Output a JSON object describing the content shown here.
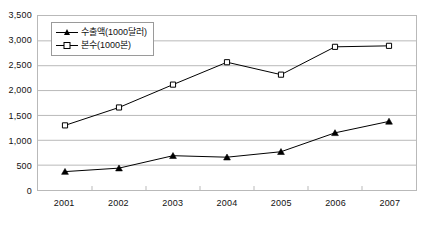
{
  "chart_data": {
    "type": "line",
    "title": "",
    "subtitle": "",
    "xlabel": "",
    "ylabel": "",
    "categories": [
      "2001",
      "2002",
      "2003",
      "2004",
      "2005",
      "2006",
      "2007"
    ],
    "x_tick_labels": [
      "2001",
      "2002",
      "2003",
      "2004",
      "2005",
      "2006",
      "2007"
    ],
    "y_tick_labels": [
      "0",
      "500",
      "1,000",
      "1,500",
      "2,000",
      "2,500",
      "3,000",
      "3,500"
    ],
    "y_tick_values": [
      0,
      500,
      1000,
      1500,
      2000,
      2500,
      3000,
      3500
    ],
    "ylim": [
      0,
      3500
    ],
    "y_step": 500,
    "grid": true,
    "grid_axis": "y",
    "legend_position": "top-left-inside",
    "series": [
      {
        "name": "수출액(1000달러)",
        "marker": "filled-triangle",
        "color": "#000000",
        "values": [
          370,
          440,
          690,
          660,
          770,
          1150,
          1380
        ]
      },
      {
        "name": "본수(1000본)",
        "marker": "open-square",
        "color": "#000000",
        "values": [
          1300,
          1660,
          2120,
          2570,
          2320,
          2880,
          2900
        ]
      }
    ]
  },
  "legend": {
    "items": [
      {
        "label": "수출액(1000달러)",
        "marker": "filled-triangle"
      },
      {
        "label": "본수(1000본)",
        "marker": "open-square"
      }
    ]
  },
  "style": {
    "background": "#ffffff",
    "plot_border": "#b9b9b9",
    "gridline": "#b9b9b9",
    "axis_text": "#111111",
    "series_line": "#000000"
  }
}
